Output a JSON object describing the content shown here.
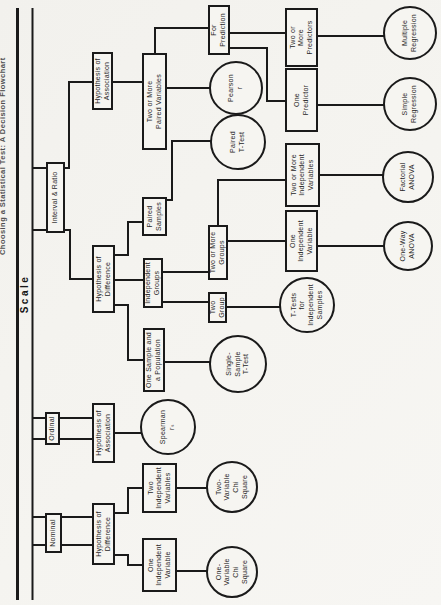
{
  "title": "Choosing a Statistical Test: A Decision Flowchart",
  "scale_label": "Scale",
  "colors": {
    "ink": "#1a1a1a",
    "paper": "#f5f4f0",
    "node_fill": "#f6f5f1"
  },
  "diagram": {
    "spine": {
      "lines": [
        {
          "x1": 5,
          "x2": 597,
          "y": 17.5,
          "w": 3
        },
        {
          "x1": 5,
          "x2": 597,
          "y": 32.5,
          "w": 2
        }
      ]
    },
    "nodes": [
      {
        "id": "interval-ratio",
        "shape": "box",
        "x": 372,
        "y": 46,
        "w": 71,
        "h": 19,
        "lines": [
          "Interval & Ratio"
        ]
      },
      {
        "id": "ordinal",
        "shape": "box",
        "x": 160,
        "y": 45,
        "w": 33,
        "h": 15,
        "lines": [
          "Ordinal"
        ]
      },
      {
        "id": "nominal",
        "shape": "box",
        "x": 52,
        "y": 45,
        "w": 40,
        "h": 17,
        "lines": [
          "Nominal"
        ]
      },
      {
        "id": "hypothesis-association-interval",
        "shape": "box",
        "x": 495,
        "y": 92,
        "w": 58,
        "h": 21,
        "lines": [
          "Hypothesis of",
          "Association"
        ]
      },
      {
        "id": "hypothesis-difference-interval",
        "shape": "box",
        "x": 292,
        "y": 92,
        "w": 68,
        "h": 23,
        "lines": [
          "Hypothesis of",
          "Difference"
        ]
      },
      {
        "id": "hypothesis-association-ordinal",
        "shape": "box",
        "x": 142,
        "y": 92,
        "w": 60,
        "h": 23,
        "lines": [
          "Hypothesis of",
          "Association"
        ]
      },
      {
        "id": "hypothesis-difference-nominal",
        "shape": "box",
        "x": 40,
        "y": 92,
        "w": 62,
        "h": 23,
        "lines": [
          "Hypothesis of",
          "Difference"
        ]
      },
      {
        "id": "two-or-more-paired-variables",
        "shape": "box",
        "x": 455,
        "y": 142,
        "w": 97,
        "h": 25,
        "lines": [
          "Two or More",
          "Paired Variables"
        ]
      },
      {
        "id": "paired-samples",
        "shape": "box",
        "x": 369,
        "y": 142,
        "w": 39,
        "h": 25,
        "lines": [
          "Paired",
          "Samples"
        ]
      },
      {
        "id": "independent-groups",
        "shape": "box",
        "x": 297,
        "y": 143,
        "w": 50,
        "h": 20,
        "lines": [
          "Independent",
          "Groups"
        ]
      },
      {
        "id": "one-sample-and-a-population",
        "shape": "box",
        "x": 213,
        "y": 143,
        "w": 64,
        "h": 22,
        "lines": [
          "One Sample and",
          "a Population"
        ]
      },
      {
        "id": "two-independent-variables-nominal",
        "shape": "box",
        "x": 92,
        "y": 142,
        "w": 50,
        "h": 35,
        "lines": [
          "Two",
          "Independent",
          "Variables"
        ]
      },
      {
        "id": "one-independent-variable-nominal",
        "shape": "box",
        "x": 13,
        "y": 142,
        "w": 54,
        "h": 35,
        "lines": [
          "One",
          "Independent",
          "Variable"
        ]
      },
      {
        "id": "for-prediction",
        "shape": "box",
        "x": 550,
        "y": 208,
        "w": 50,
        "h": 22,
        "lines": [
          "For",
          "Prediction"
        ]
      },
      {
        "id": "two-or-more-groups",
        "shape": "box",
        "x": 325,
        "y": 208,
        "w": 55,
        "h": 20,
        "lines": [
          "Two or More",
          "Groups"
        ]
      },
      {
        "id": "two-group",
        "shape": "box",
        "x": 282,
        "y": 208,
        "w": 31,
        "h": 19,
        "lines": [
          "Two",
          "Group"
        ]
      },
      {
        "id": "two-or-more-predictors",
        "shape": "box",
        "x": 538,
        "y": 285,
        "w": 59,
        "h": 33,
        "lines": [
          "Two or",
          "More",
          "Predictors"
        ]
      },
      {
        "id": "one-predictor",
        "shape": "box",
        "x": 473,
        "y": 285,
        "w": 64,
        "h": 33,
        "lines": [
          "One",
          "Predictor"
        ]
      },
      {
        "id": "two-or-more-independent-variables",
        "shape": "box",
        "x": 398,
        "y": 285,
        "w": 64,
        "h": 35,
        "lines": [
          "Two or More",
          "Independent",
          "Variables"
        ]
      },
      {
        "id": "one-independent-variable-interval",
        "shape": "box",
        "x": 333,
        "y": 285,
        "w": 62,
        "h": 33,
        "lines": [
          "One",
          "Independent",
          "Variable"
        ]
      },
      {
        "id": "pearson-r",
        "shape": "circle",
        "cx": 517,
        "cy": 236,
        "r": 27,
        "lines": [
          "Pearson",
          "r"
        ]
      },
      {
        "id": "paired-t-test",
        "shape": "circle",
        "cx": 463,
        "cy": 238,
        "r": 28,
        "lines": [
          "Paired",
          "T-Test"
        ]
      },
      {
        "id": "single-sample-t-test",
        "shape": "circle",
        "cx": 241,
        "cy": 238,
        "r": 29,
        "lines": [
          "Single-",
          "Sample",
          "T-Test"
        ]
      },
      {
        "id": "t-tests-for-independent-samples",
        "shape": "circle",
        "cx": 300,
        "cy": 307,
        "r": 28,
        "lines": [
          "T-Tests",
          "for",
          "Independent",
          "Samples"
        ]
      },
      {
        "id": "spearman-rs",
        "shape": "circle",
        "cx": 178,
        "cy": 168,
        "r": 28,
        "lines": [
          "Spearman",
          "rₛ"
        ]
      },
      {
        "id": "two-variable-chi-square",
        "shape": "circle",
        "cx": 118,
        "cy": 232,
        "r": 26,
        "lines": [
          "Two-",
          "Variable",
          "Chi",
          "Square"
        ]
      },
      {
        "id": "one-variable-chi-square",
        "shape": "circle",
        "cx": 33,
        "cy": 232,
        "r": 26,
        "lines": [
          "One-",
          "Variable",
          "Chi",
          "Square"
        ]
      },
      {
        "id": "multiple-regression",
        "shape": "circle",
        "cx": 572,
        "cy": 410,
        "r": 27,
        "lines": [
          "Multiple",
          "Regression"
        ]
      },
      {
        "id": "simple-regression",
        "shape": "circle",
        "cx": 501,
        "cy": 410,
        "r": 27,
        "lines": [
          "Simple",
          "Regression"
        ]
      },
      {
        "id": "factorial-anova",
        "shape": "circle",
        "cx": 428,
        "cy": 408,
        "r": 26,
        "lines": [
          "Factorial",
          "ANOVA"
        ]
      },
      {
        "id": "one-way-anova",
        "shape": "circle",
        "cx": 359,
        "cy": 408,
        "r": 25,
        "lines": [
          "One-Way",
          "ANOVA"
        ]
      }
    ],
    "edges": [
      [
        [
          375,
          33
        ],
        [
          375,
          46
        ]
      ],
      [
        [
          437,
          33
        ],
        [
          437,
          46
        ]
      ],
      [
        [
          166,
          33
        ],
        [
          166,
          45
        ]
      ],
      [
        [
          187,
          33
        ],
        [
          187,
          45
        ]
      ],
      [
        [
          60,
          33
        ],
        [
          60,
          45
        ]
      ],
      [
        [
          88,
          33
        ],
        [
          88,
          45
        ]
      ],
      [
        [
          437,
          65
        ],
        [
          437,
          69
        ],
        [
          523,
          69
        ],
        [
          523,
          92
        ]
      ],
      [
        [
          375,
          65
        ],
        [
          375,
          70
        ],
        [
          326,
          70
        ],
        [
          326,
          92
        ]
      ],
      [
        [
          166,
          60
        ],
        [
          166,
          92
        ]
      ],
      [
        [
          187,
          60
        ],
        [
          187,
          92
        ]
      ],
      [
        [
          60,
          62
        ],
        [
          60,
          92
        ]
      ],
      [
        [
          88,
          62
        ],
        [
          88,
          92
        ]
      ],
      [
        [
          523,
          113
        ],
        [
          523,
          142
        ]
      ],
      [
        [
          517,
          167
        ],
        [
          517,
          213
        ]
      ],
      [
        [
          552,
          155
        ],
        [
          577,
          155
        ],
        [
          577,
          208
        ]
      ],
      [
        [
          572,
          230
        ],
        [
          572,
          285
        ]
      ],
      [
        [
          557,
          230
        ],
        [
          557,
          267
        ],
        [
          504,
          267
        ],
        [
          504,
          285
        ]
      ],
      [
        [
          569,
          318
        ],
        [
          569,
          388
        ]
      ],
      [
        [
          500,
          318
        ],
        [
          500,
          388
        ]
      ],
      [
        [
          325,
          115
        ],
        [
          325,
          143
        ]
      ],
      [
        [
          350,
          115
        ],
        [
          350,
          128
        ],
        [
          383,
          128
        ],
        [
          383,
          142
        ]
      ],
      [
        [
          300,
          115
        ],
        [
          300,
          128
        ],
        [
          245,
          128
        ],
        [
          245,
          143
        ]
      ],
      [
        [
          405,
          167
        ],
        [
          405,
          172
        ],
        [
          464,
          172
        ],
        [
          464,
          214
        ]
      ],
      [
        [
          333,
          163
        ],
        [
          333,
          208
        ]
      ],
      [
        [
          303,
          163
        ],
        [
          303,
          208
        ]
      ],
      [
        [
          364,
          228
        ],
        [
          364,
          285
        ]
      ],
      [
        [
          380,
          218
        ],
        [
          425,
          218
        ],
        [
          425,
          285
        ]
      ],
      [
        [
          359,
          318
        ],
        [
          359,
          386
        ]
      ],
      [
        [
          430,
          320
        ],
        [
          430,
          386
        ]
      ],
      [
        [
          298,
          227
        ],
        [
          298,
          283
        ]
      ],
      [
        [
          243,
          165
        ],
        [
          243,
          212
        ]
      ],
      [
        [
          172,
          115
        ],
        [
          172,
          143
        ]
      ],
      [
        [
          117,
          177
        ],
        [
          117,
          210
        ]
      ],
      [
        [
          34,
          177
        ],
        [
          34,
          209
        ]
      ],
      [
        [
          92,
          115
        ],
        [
          92,
          128
        ],
        [
          117,
          128
        ],
        [
          117,
          142
        ]
      ],
      [
        [
          50,
          115
        ],
        [
          50,
          128
        ],
        [
          40,
          128
        ],
        [
          40,
          142
        ]
      ]
    ]
  }
}
